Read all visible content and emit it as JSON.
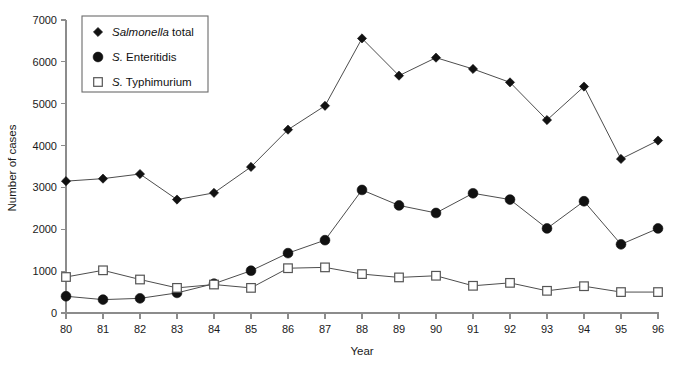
{
  "chart_data": {
    "type": "line",
    "title": "",
    "xlabel": "Year",
    "ylabel": "Number of cases",
    "x": [
      "80",
      "81",
      "82",
      "83",
      "84",
      "85",
      "86",
      "87",
      "88",
      "89",
      "90",
      "91",
      "92",
      "93",
      "94",
      "95",
      "96"
    ],
    "xlim": [
      80,
      96
    ],
    "ylim": [
      0,
      7000
    ],
    "yticks": [
      0,
      1000,
      2000,
      3000,
      4000,
      5000,
      6000,
      7000
    ],
    "ytick_labels": [
      "0",
      "1000",
      "2000",
      "3000",
      "4000",
      "5000",
      "6000",
      "7000"
    ],
    "xticks": [
      80,
      81,
      82,
      83,
      84,
      85,
      86,
      87,
      88,
      89,
      90,
      91,
      92,
      93,
      94,
      95,
      96
    ],
    "grid": false,
    "legend_position": "upper-left",
    "series": [
      {
        "name": "Salmonella total",
        "name_italic_prefix": "Salmonella",
        "name_plain_suffix": " total",
        "marker": "diamond",
        "values": [
          3150,
          3210,
          3320,
          2710,
          2870,
          3490,
          4380,
          4950,
          6560,
          5670,
          6100,
          5830,
          5510,
          4610,
          5410,
          3680,
          4120
        ]
      },
      {
        "name": "S. Enteritidis",
        "name_italic_prefix": "S.",
        "name_plain_suffix": " Enteritidis",
        "marker": "circle",
        "values": [
          400,
          320,
          350,
          480,
          700,
          1010,
          1430,
          1740,
          2940,
          2570,
          2390,
          2860,
          2710,
          2020,
          2670,
          1640,
          2020
        ]
      },
      {
        "name": "S. Typhimurium",
        "name_italic_prefix": "S.",
        "name_plain_suffix": " Typhimurium",
        "marker": "square",
        "values": [
          860,
          1020,
          800,
          600,
          680,
          600,
          1070,
          1090,
          930,
          850,
          890,
          650,
          720,
          530,
          640,
          500,
          500
        ]
      }
    ]
  },
  "axis": {
    "y_title": "Number of cases",
    "x_title": "Year"
  },
  "legend": {
    "items": [
      {
        "marker": "diamond",
        "italic": "Salmonella",
        "plain": " total"
      },
      {
        "marker": "circle",
        "italic": "S.",
        "plain": " Enteritidis"
      },
      {
        "marker": "square",
        "italic": "S.",
        "plain": " Typhimurium"
      }
    ]
  },
  "colors": {
    "marker_fill": "#111111",
    "open_marker_fill": "#ffffff",
    "line": "#4d4d4d",
    "axis": "#8c8c8c",
    "text": "#1a1a1a"
  }
}
